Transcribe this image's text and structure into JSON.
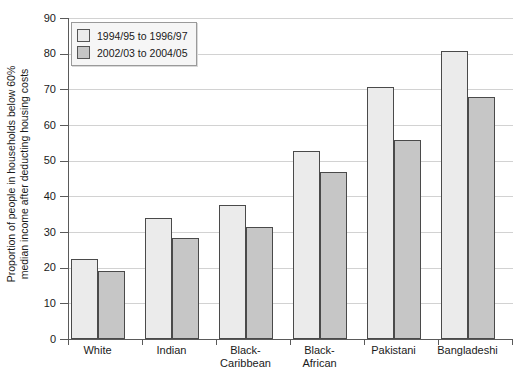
{
  "chart_data": {
    "type": "bar",
    "title": "",
    "xlabel": "",
    "ylabel": "Proportion of people in households below 60% median income after deducting housing costs",
    "ylabel_lines": [
      "Proportion of people in households below 60%",
      "median income after deducting housing costs"
    ],
    "ylim": [
      0,
      90
    ],
    "ytick_step": 10,
    "ytick_labels": [
      "90",
      "80",
      "70",
      "60",
      "50",
      "40",
      "30",
      "20",
      "10",
      "0"
    ],
    "ytick_values": [
      90,
      80,
      70,
      60,
      50,
      40,
      30,
      20,
      10,
      0
    ],
    "grid": true,
    "grid_axis": "y",
    "legend_position": "top-left",
    "categories": [
      "White",
      "Indian",
      "Black-Caribbean",
      "Black-African",
      "Pakistani",
      "Bangladeshi"
    ],
    "category_label_lines": [
      [
        "White"
      ],
      [
        "Indian"
      ],
      [
        "Black-",
        "Caribbean"
      ],
      [
        "Black-",
        "African"
      ],
      [
        "Pakistani"
      ],
      [
        "Bangladeshi"
      ]
    ],
    "series": [
      {
        "name": "1994/95 to 1996/97",
        "color": "#ebebeb",
        "values": [
          22.5,
          34.0,
          37.5,
          52.7,
          70.8,
          80.8
        ]
      },
      {
        "name": "2002/03 to 2004/05",
        "color": "#c6c6c6",
        "values": [
          19.2,
          28.3,
          31.3,
          46.7,
          55.9,
          68.0
        ]
      }
    ]
  },
  "legend": {
    "items": [
      {
        "label": "1994/95 to 1996/97",
        "swatch": "light-gray-swatch"
      },
      {
        "label": "2002/03 to 2004/05",
        "swatch": "medium-gray-swatch"
      }
    ]
  },
  "colors": {
    "series_1": "#ebebeb",
    "series_2": "#c6c6c6",
    "bar_outline": "#4a4a4a",
    "axis": "#5a5a5a",
    "gridline": "#d2d2d2",
    "background": "#ffffff"
  }
}
